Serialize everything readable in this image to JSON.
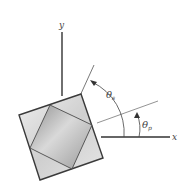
{
  "diagram": {
    "type": "stress-element-rotation",
    "axes": {
      "x_label": "x",
      "y_label": "y"
    },
    "angles": [
      {
        "symbol": "θ",
        "subscript": "s",
        "description": "angle from x-axis to max shear plane"
      },
      {
        "symbol": "θ",
        "subscript": "p",
        "description": "angle from x-axis to principal plane"
      }
    ],
    "colors": {
      "outline": "#3a3a3a",
      "axis": "#333333",
      "guide_line": "#777777",
      "outer_fill": "#d8d8d8",
      "inner_fill": "#a8a8a8",
      "label": "#444444"
    }
  }
}
